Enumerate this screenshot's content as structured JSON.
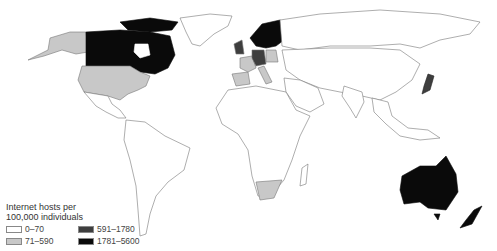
{
  "map": {
    "type": "choropleth",
    "projection": "world",
    "colors": {
      "background": "#ffffff",
      "border": "#777777",
      "bin1": "#ffffff",
      "bin2": "#c8c8c8",
      "bin3": "#3e3e3e",
      "bin4": "#0a0a0a"
    },
    "regions": [
      {
        "name": "Canada",
        "bin": "1781-5600"
      },
      {
        "name": "United States",
        "bin": "71-590"
      },
      {
        "name": "Alaska",
        "bin": "71-590"
      },
      {
        "name": "Greenland",
        "bin": "0-70"
      },
      {
        "name": "Norway",
        "bin": "1781-5600"
      },
      {
        "name": "Sweden",
        "bin": "1781-5600"
      },
      {
        "name": "Finland",
        "bin": "1781-5600"
      },
      {
        "name": "United Kingdom",
        "bin": "591-1780"
      },
      {
        "name": "Netherlands",
        "bin": "591-1780"
      },
      {
        "name": "Germany",
        "bin": "591-1780"
      },
      {
        "name": "Switzerland",
        "bin": "591-1780"
      },
      {
        "name": "France",
        "bin": "71-590"
      },
      {
        "name": "Spain",
        "bin": "71-590"
      },
      {
        "name": "Poland",
        "bin": "71-590"
      },
      {
        "name": "Italy",
        "bin": "71-590"
      },
      {
        "name": "Japan",
        "bin": "591-1780"
      },
      {
        "name": "Australia",
        "bin": "1781-5600"
      },
      {
        "name": "New Zealand",
        "bin": "1781-5600"
      },
      {
        "name": "South Africa",
        "bin": "71-590"
      }
    ]
  },
  "legend": {
    "title_line1": "Internet hosts per",
    "title_line2": "100,000 individuals",
    "items": [
      {
        "label": "0–70",
        "color": "#ffffff"
      },
      {
        "label": "591–1780",
        "color": "#3e3e3e"
      },
      {
        "label": "71–590",
        "color": "#c8c8c8"
      },
      {
        "label": "1781–5600",
        "color": "#0a0a0a"
      }
    ]
  }
}
